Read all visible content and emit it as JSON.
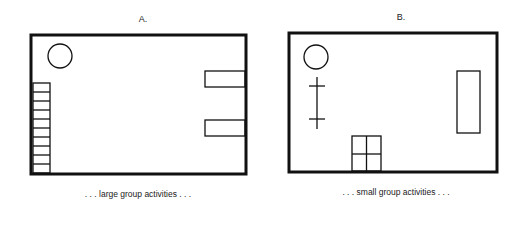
{
  "panels": [
    {
      "id": "A",
      "label": "A.",
      "caption": ". . . large group activities . . .",
      "elements": [
        "circle",
        "stacked-shelves-left",
        "two-tables-right"
      ]
    },
    {
      "id": "B",
      "label": "B.",
      "caption": ". . . small group activities . . .",
      "elements": [
        "circle",
        "vertical-line-with-crossbars",
        "four-square-grid-bottom",
        "tall-rectangle-right"
      ]
    }
  ]
}
